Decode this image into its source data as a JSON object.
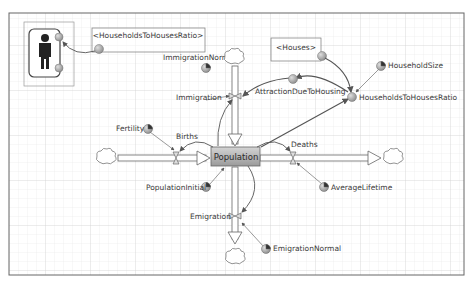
{
  "diagram": {
    "type": "stock-and-flow",
    "stock": {
      "label": "Population"
    },
    "flows": [
      {
        "id": "births",
        "label": "Births"
      },
      {
        "id": "deaths",
        "label": "Deaths"
      },
      {
        "id": "immigration",
        "label": "Immigration"
      },
      {
        "id": "emigration",
        "label": "Emigration"
      }
    ],
    "parameters": [
      {
        "id": "fertility",
        "label": "Fertility"
      },
      {
        "id": "averagelifetime",
        "label": "AverageLifetime"
      },
      {
        "id": "immigrationnormal",
        "label": "ImmigrationNormal"
      },
      {
        "id": "emigrationnormal",
        "label": "EmigrationNormal"
      },
      {
        "id": "populationinitial",
        "label": "PopulationInitial"
      },
      {
        "id": "householdsize",
        "label": "HouseholdSize"
      }
    ],
    "auxiliaries": [
      {
        "id": "attraction",
        "label": "AttractionDueToHousing"
      },
      {
        "id": "ratio",
        "label": "HouseholdsToHousesRatio"
      }
    ],
    "references": [
      {
        "id": "houses_ref",
        "label": "<Houses>"
      },
      {
        "id": "ratio_ref",
        "label": "<HouseholdsToHousesRatio>"
      }
    ],
    "agent_icon": {
      "name": "person"
    }
  },
  "colors": {
    "grid": "#e2e2e2",
    "grid_major": "#cfcfcf",
    "border": "#555555",
    "stock_fill": "#a9a9a9",
    "link": "#555555"
  }
}
